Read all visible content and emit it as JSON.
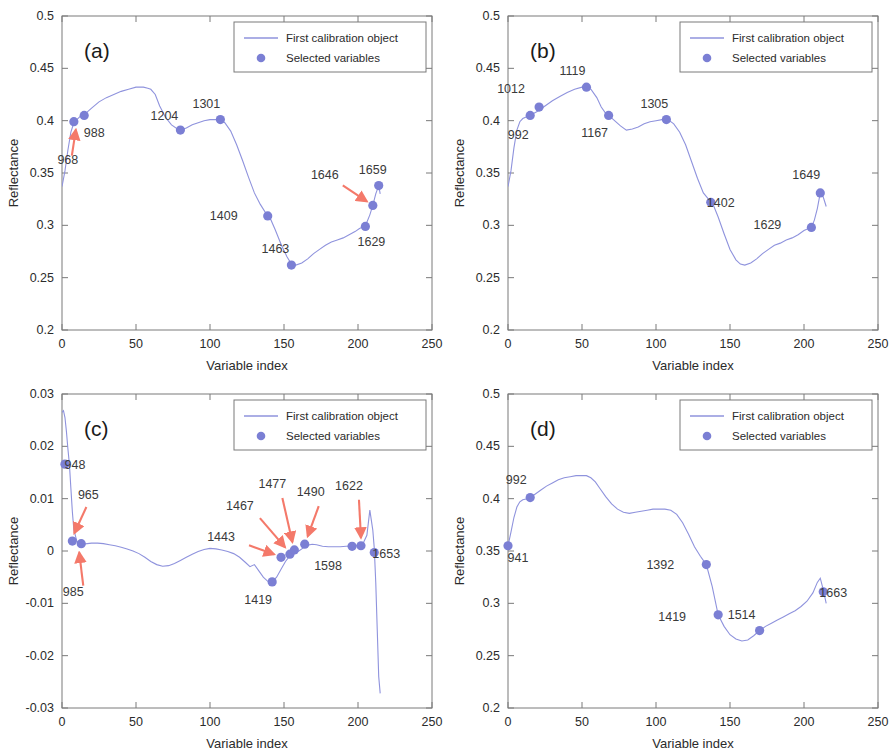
{
  "figure": {
    "panels": [
      "(a)",
      "(b)",
      "(c)",
      "(d)"
    ],
    "axis_label_x": "Variable index",
    "axis_label_y": "Reflectance",
    "legend": {
      "line_label": "First calibration object",
      "marker_label": "Selected variables"
    },
    "colors": {
      "curve": "#8f93dd",
      "marker": "#7b7fd4",
      "arrow": "#f4796a",
      "axis": "#7a7a7a",
      "text": "#3a3a3a"
    }
  },
  "chart_data": [
    {
      "type": "line",
      "panel": "(a)",
      "title": "(a)",
      "xlabel": "Variable index",
      "ylabel": "Reflectance",
      "xlim": [
        0,
        250
      ],
      "ylim": [
        0.2,
        0.5
      ],
      "xticks": [
        0,
        50,
        100,
        150,
        200,
        250
      ],
      "yticks": [
        "0.2",
        "0.25",
        "0.3",
        "0.35",
        "0.4",
        "0.45",
        "0.5"
      ],
      "grid": false,
      "legend_position": "top-right",
      "series": [
        {
          "name": "First calibration object",
          "x": [
            0,
            2,
            4,
            6,
            8,
            10,
            13,
            16,
            20,
            25,
            30,
            35,
            40,
            45,
            50,
            55,
            58,
            60,
            63,
            66,
            70,
            74,
            78,
            80,
            84,
            88,
            92,
            96,
            100,
            104,
            107,
            110,
            114,
            118,
            122,
            126,
            130,
            134,
            138,
            140,
            144,
            148,
            152,
            155,
            158,
            162,
            166,
            170,
            174,
            178,
            182,
            186,
            190,
            194,
            198,
            201,
            204,
            206,
            208,
            210,
            212,
            214,
            215
          ],
          "y": [
            0.337,
            0.352,
            0.372,
            0.389,
            0.398,
            0.401,
            0.405,
            0.407,
            0.412,
            0.418,
            0.422,
            0.425,
            0.428,
            0.43,
            0.432,
            0.432,
            0.431,
            0.43,
            0.425,
            0.414,
            0.403,
            0.396,
            0.392,
            0.391,
            0.393,
            0.396,
            0.398,
            0.4,
            0.401,
            0.401,
            0.401,
            0.398,
            0.39,
            0.377,
            0.362,
            0.346,
            0.331,
            0.32,
            0.311,
            0.309,
            0.296,
            0.282,
            0.27,
            0.263,
            0.262,
            0.264,
            0.268,
            0.273,
            0.277,
            0.281,
            0.284,
            0.286,
            0.288,
            0.291,
            0.294,
            0.297,
            0.299,
            0.303,
            0.31,
            0.319,
            0.33,
            0.338,
            0.33
          ]
        }
      ],
      "markers": [
        {
          "label": "968",
          "x": 8,
          "y": 0.399,
          "label_dx": -6,
          "label_dy": 42,
          "arrow": true,
          "arrow_from_dx": -2,
          "arrow_from_dy": 34,
          "arrow_to_dx": 2,
          "arrow_to_dy": 8
        },
        {
          "label": "988",
          "x": 15,
          "y": 0.405,
          "label_dx": 10,
          "label_dy": 22,
          "arrow": false
        },
        {
          "label": "1204",
          "x": 80,
          "y": 0.391,
          "label_dx": -16,
          "label_dy": -10,
          "arrow": false
        },
        {
          "label": "1301",
          "x": 107,
          "y": 0.401,
          "label_dx": -14,
          "label_dy": -12,
          "arrow": false
        },
        {
          "label": "1409",
          "x": 139,
          "y": 0.309,
          "label_dx": -44,
          "label_dy": 4,
          "arrow": false
        },
        {
          "label": "1463",
          "x": 155,
          "y": 0.262,
          "label_dx": -16,
          "label_dy": -12,
          "arrow": false
        },
        {
          "label": "1629",
          "x": 205,
          "y": 0.299,
          "label_dx": 6,
          "label_dy": 20,
          "arrow": false
        },
        {
          "label": "1646",
          "x": 210,
          "y": 0.319,
          "label_dx": -48,
          "label_dy": -26,
          "arrow": true,
          "arrow_from_dx": -30,
          "arrow_from_dy": -20,
          "arrow_to_dx": -6,
          "arrow_to_dy": -4
        },
        {
          "label": "1659",
          "x": 214,
          "y": 0.338,
          "label_dx": -6,
          "label_dy": -12,
          "arrow": false
        }
      ]
    },
    {
      "type": "line",
      "panel": "(b)",
      "title": "(b)",
      "xlabel": "Variable index",
      "ylabel": "Reflectance",
      "xlim": [
        0,
        250
      ],
      "ylim": [
        0.2,
        0.5
      ],
      "xticks": [
        0,
        50,
        100,
        150,
        200,
        250
      ],
      "yticks": [
        "0.2",
        "0.25",
        "0.3",
        "0.35",
        "0.4",
        "0.45",
        "0.5"
      ],
      "grid": false,
      "legend_position": "top-right",
      "series": [
        {
          "name": "First calibration object",
          "x": [
            0,
            2,
            4,
            6,
            8,
            10,
            13,
            16,
            20,
            25,
            30,
            35,
            40,
            45,
            50,
            53,
            56,
            60,
            63,
            66,
            68,
            72,
            76,
            80,
            84,
            88,
            92,
            96,
            100,
            104,
            108,
            112,
            116,
            120,
            124,
            128,
            132,
            136,
            138,
            142,
            146,
            150,
            154,
            157,
            160,
            164,
            168,
            172,
            176,
            180,
            184,
            188,
            192,
            196,
            200,
            203,
            205,
            207,
            209,
            211,
            213,
            215
          ],
          "y": [
            0.337,
            0.352,
            0.374,
            0.391,
            0.399,
            0.402,
            0.404,
            0.406,
            0.409,
            0.414,
            0.419,
            0.423,
            0.427,
            0.43,
            0.432,
            0.432,
            0.43,
            0.422,
            0.413,
            0.407,
            0.405,
            0.4,
            0.395,
            0.391,
            0.392,
            0.394,
            0.397,
            0.399,
            0.4,
            0.401,
            0.401,
            0.397,
            0.389,
            0.377,
            0.361,
            0.345,
            0.331,
            0.324,
            0.322,
            0.308,
            0.292,
            0.277,
            0.267,
            0.263,
            0.262,
            0.264,
            0.268,
            0.273,
            0.277,
            0.281,
            0.283,
            0.286,
            0.288,
            0.291,
            0.295,
            0.297,
            0.298,
            0.305,
            0.316,
            0.331,
            0.327,
            0.318
          ]
        }
      ],
      "markers": [
        {
          "label": "992",
          "x": 15,
          "y": 0.405,
          "label_dx": -12,
          "label_dy": 24,
          "arrow": false
        },
        {
          "label": "1012",
          "x": 21,
          "y": 0.413,
          "label_dx": -28,
          "label_dy": -14,
          "arrow": false
        },
        {
          "label": "1119",
          "x": 53,
          "y": 0.432,
          "label_dx": -14,
          "label_dy": -12,
          "arrow": false
        },
        {
          "label": "1167",
          "x": 68,
          "y": 0.405,
          "label_dx": -14,
          "label_dy": 22,
          "arrow": false
        },
        {
          "label": "1305",
          "x": 107,
          "y": 0.401,
          "label_dx": -12,
          "label_dy": -12,
          "arrow": false
        },
        {
          "label": "1402",
          "x": 137,
          "y": 0.322,
          "label_dx": 10,
          "label_dy": 5,
          "arrow": false
        },
        {
          "label": "1629",
          "x": 205,
          "y": 0.298,
          "label_dx": -44,
          "label_dy": 2,
          "arrow": false
        },
        {
          "label": "1649",
          "x": 211,
          "y": 0.331,
          "label_dx": -14,
          "label_dy": -14,
          "arrow": false
        }
      ]
    },
    {
      "type": "line",
      "panel": "(c)",
      "title": "(c)",
      "xlabel": "Variable index",
      "ylabel": "Reflectance",
      "xlim": [
        0,
        250
      ],
      "ylim": [
        -0.03,
        0.03
      ],
      "xticks": [
        0,
        50,
        100,
        150,
        200,
        250
      ],
      "yticks": [
        "-0.03",
        "-0.02",
        "-0.01",
        "0",
        "0.01",
        "0.02",
        "0.03"
      ],
      "grid": false,
      "legend_position": "top-right",
      "series": [
        {
          "name": "First calibration object",
          "x": [
            0,
            1,
            2,
            3,
            4,
            5,
            6,
            7,
            8,
            10,
            12,
            14,
            17,
            20,
            24,
            28,
            32,
            36,
            40,
            44,
            48,
            52,
            56,
            60,
            64,
            68,
            72,
            76,
            80,
            84,
            88,
            92,
            96,
            100,
            104,
            108,
            112,
            116,
            120,
            124,
            127,
            130,
            133,
            136,
            139,
            142,
            145,
            148,
            151,
            154,
            157,
            160,
            163,
            166,
            169,
            172,
            176,
            180,
            184,
            188,
            192,
            196,
            200,
            203,
            206,
            208,
            210,
            211,
            212,
            213,
            214,
            215
          ],
          "y": [
            0.0265,
            0.0268,
            0.0255,
            0.0228,
            0.0195,
            0.0166,
            0.012,
            0.0075,
            0.0041,
            0.0019,
            0.0014,
            0.0013,
            0.0014,
            0.0015,
            0.0015,
            0.0014,
            0.0012,
            0.001,
            0.0007,
            0.0004,
            0.0,
            -0.0005,
            -0.0012,
            -0.002,
            -0.0026,
            -0.0029,
            -0.0028,
            -0.0024,
            -0.0018,
            -0.0012,
            -0.0006,
            -0.0001,
            0.0003,
            0.0005,
            0.0004,
            0.0002,
            -0.0001,
            -0.0005,
            -0.0012,
            -0.0022,
            -0.003,
            -0.0026,
            -0.0038,
            -0.005,
            -0.0058,
            -0.0059,
            -0.005,
            -0.0035,
            -0.002,
            -0.0009,
            -0.0004,
            0.0,
            0.0006,
            0.0011,
            0.0013,
            0.0012,
            0.0009,
            0.0008,
            0.0008,
            0.0008,
            0.0009,
            0.001,
            0.0011,
            0.0012,
            0.003,
            0.0078,
            0.004,
            0.0005,
            -0.006,
            -0.015,
            -0.024,
            -0.0272
          ]
        }
      ],
      "markers": [
        {
          "label": "948",
          "x": 2,
          "y": 0.0166,
          "label_dx": 10,
          "label_dy": 5,
          "arrow": false
        },
        {
          "label": "965",
          "x": 7,
          "y": 0.0019,
          "label_dx": 16,
          "label_dy": -42,
          "arrow": true,
          "arrow_from_dx": 14,
          "arrow_from_dy": -34,
          "arrow_to_dx": 2,
          "arrow_to_dy": -8
        },
        {
          "label": "985",
          "x": 13,
          "y": 0.0014,
          "label_dx": -8,
          "label_dy": 52,
          "arrow": true,
          "arrow_from_dx": 2,
          "arrow_from_dy": 42,
          "arrow_to_dx": -2,
          "arrow_to_dy": 9
        },
        {
          "label": "1419",
          "x": 142,
          "y": -0.0059,
          "label_dx": -14,
          "label_dy": 22,
          "arrow": false
        },
        {
          "label": "1443",
          "x": 148,
          "y": -0.0012,
          "label_dx": -60,
          "label_dy": -16,
          "arrow": true,
          "arrow_from_dx": -32,
          "arrow_from_dy": -12,
          "arrow_to_dx": -7,
          "arrow_to_dy": -3
        },
        {
          "label": "1467",
          "x": 154,
          "y": -0.0006,
          "label_dx": -50,
          "label_dy": -44,
          "arrow": true,
          "arrow_from_dx": -30,
          "arrow_from_dy": -36,
          "arrow_to_dx": -5,
          "arrow_to_dy": -7
        },
        {
          "label": "1477",
          "x": 157,
          "y": 0.0002,
          "label_dx": -22,
          "label_dy": -62,
          "arrow": true,
          "arrow_from_dx": -12,
          "arrow_from_dy": -52,
          "arrow_to_dx": -2,
          "arrow_to_dy": -8
        },
        {
          "label": "1490",
          "x": 164,
          "y": 0.0013,
          "label_dx": 6,
          "label_dy": -48,
          "arrow": true,
          "arrow_from_dx": 14,
          "arrow_from_dy": -38,
          "arrow_to_dx": 3,
          "arrow_to_dy": -8
        },
        {
          "label": "1598",
          "x": 196,
          "y": 0.0009,
          "label_dx": -24,
          "label_dy": 24,
          "arrow": false
        },
        {
          "label": "1622",
          "x": 202,
          "y": 0.001,
          "label_dx": -12,
          "label_dy": -56,
          "arrow": true,
          "arrow_from_dx": -2,
          "arrow_from_dy": -46,
          "arrow_to_dx": 0,
          "arrow_to_dy": -8
        },
        {
          "label": "1653",
          "x": 211,
          "y": -0.0003,
          "label_dx": 12,
          "label_dy": 5,
          "arrow": false
        }
      ]
    },
    {
      "type": "line",
      "panel": "(d)",
      "title": "(d)",
      "xlabel": "Variable index",
      "ylabel": "Reflectance",
      "xlim": [
        0,
        250
      ],
      "ylim": [
        0.2,
        0.5
      ],
      "xticks": [
        0,
        50,
        100,
        150,
        200,
        250
      ],
      "yticks": [
        "0.2",
        "0.25",
        "0.3",
        "0.35",
        "0.4",
        "0.45",
        "0.5"
      ],
      "grid": false,
      "legend_position": "top-right",
      "series": [
        {
          "name": "First calibration object",
          "x": [
            0,
            2,
            4,
            6,
            8,
            10,
            13,
            15,
            18,
            22,
            26,
            30,
            34,
            38,
            42,
            46,
            50,
            53,
            56,
            59,
            62,
            66,
            70,
            74,
            78,
            82,
            86,
            90,
            94,
            98,
            102,
            106,
            110,
            114,
            118,
            122,
            126,
            130,
            134,
            138,
            142,
            146,
            150,
            154,
            158,
            162,
            166,
            170,
            174,
            178,
            182,
            186,
            190,
            194,
            198,
            202,
            206,
            209,
            211,
            213,
            215
          ],
          "y": [
            0.355,
            0.368,
            0.382,
            0.392,
            0.397,
            0.399,
            0.4,
            0.401,
            0.404,
            0.408,
            0.412,
            0.415,
            0.418,
            0.42,
            0.421,
            0.422,
            0.422,
            0.422,
            0.42,
            0.416,
            0.41,
            0.402,
            0.395,
            0.39,
            0.387,
            0.386,
            0.387,
            0.388,
            0.389,
            0.39,
            0.39,
            0.39,
            0.389,
            0.385,
            0.377,
            0.366,
            0.354,
            0.345,
            0.337,
            0.316,
            0.289,
            0.278,
            0.27,
            0.266,
            0.264,
            0.265,
            0.269,
            0.274,
            0.278,
            0.281,
            0.284,
            0.287,
            0.29,
            0.293,
            0.297,
            0.302,
            0.31,
            0.32,
            0.324,
            0.313,
            0.3
          ]
        }
      ],
      "markers": [
        {
          "label": "941",
          "x": 0,
          "y": 0.355,
          "label_dx": 10,
          "label_dy": 16,
          "arrow": false
        },
        {
          "label": "992",
          "x": 15,
          "y": 0.401,
          "label_dx": -14,
          "label_dy": -14,
          "arrow": false
        },
        {
          "label": "1392",
          "x": 134,
          "y": 0.337,
          "label_dx": -46,
          "label_dy": 4,
          "arrow": false
        },
        {
          "label": "1419",
          "x": 142,
          "y": 0.289,
          "label_dx": -46,
          "label_dy": 6,
          "arrow": false
        },
        {
          "label": "1514",
          "x": 170,
          "y": 0.274,
          "label_dx": -18,
          "label_dy": -12,
          "arrow": false
        },
        {
          "label": "1663",
          "x": 213,
          "y": 0.311,
          "label_dx": 10,
          "label_dy": 5,
          "arrow": false
        }
      ]
    }
  ]
}
